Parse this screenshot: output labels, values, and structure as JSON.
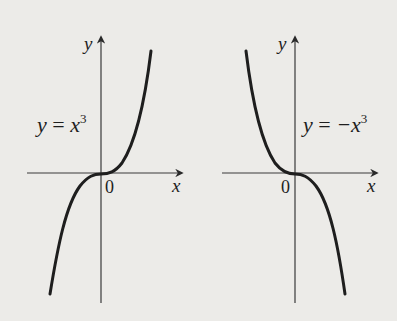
{
  "colors": {
    "background": "#ecebe8",
    "ink": "#1e1e1e",
    "axis": "#3a3a3a"
  },
  "graphs": [
    {
      "id": "cubic",
      "function_label": {
        "lhs": "y",
        "eq": " = ",
        "rhs": "x",
        "exp": "3"
      },
      "x_axis_label": "x",
      "y_axis_label": "y",
      "origin_label": "0"
    },
    {
      "id": "negative-cubic",
      "function_label": {
        "lhs": "y",
        "eq": " = ",
        "rhs": "−x",
        "exp": "3"
      },
      "x_axis_label": "x",
      "y_axis_label": "y",
      "origin_label": "0"
    }
  ]
}
